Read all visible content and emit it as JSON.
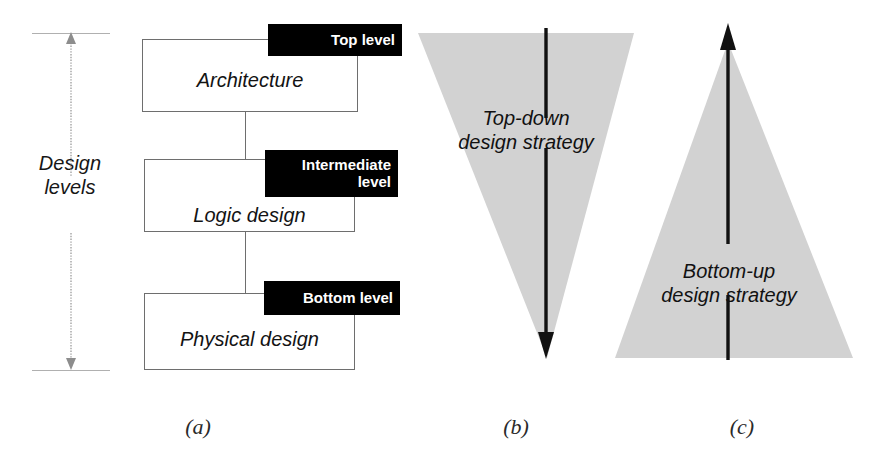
{
  "figure": {
    "background": "#ffffff",
    "triangle_fill": "#d2d2d2",
    "tag_background": "#000000",
    "tag_text_color": "#ffffff",
    "box_border_color": "#6e6e6e"
  },
  "panel_a": {
    "caption": "(a)",
    "dimension": {
      "label_line1": "Design",
      "label_line2": "levels"
    },
    "levels": [
      {
        "tag": "Top level",
        "tag_line1": "Top level",
        "tag_line2": "",
        "body": "Architecture"
      },
      {
        "tag": "Intermediate level",
        "tag_line1": "Intermediate",
        "tag_line2": "level",
        "body": "Logic design"
      },
      {
        "tag": "Bottom level",
        "tag_line1": "Bottom level",
        "tag_line2": "",
        "body": "Physical design"
      }
    ]
  },
  "panel_b": {
    "caption": "(b)",
    "shape": "inverted-triangle",
    "arrow_direction": "down",
    "label_line1": "Top-down",
    "label_line2": "design strategy"
  },
  "panel_c": {
    "caption": "(c)",
    "shape": "triangle",
    "arrow_direction": "up",
    "label_line1": "Bottom-up",
    "label_line2": "design strategy"
  }
}
